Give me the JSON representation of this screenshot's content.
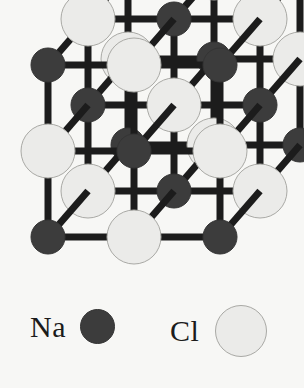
{
  "figure": {
    "kind": "crystal-lattice-diagram",
    "background_color": "#f7f7f5"
  },
  "chart_data": {
    "type": "scatter",
    "xlabel": "",
    "ylabel": "",
    "projection": "oblique",
    "grid_dimensions": [
      3,
      3,
      3
    ],
    "lattice_rule": "alternating: Na where (i+j+k) is even, Cl where (i+j+k) is odd",
    "origin": [
      48,
      237
    ],
    "step_x": 86,
    "step_y": -86,
    "depth_dx": 40,
    "depth_dy": -46,
    "bond_color": "#1c1c1c",
    "bond_width": 7,
    "species": [
      {
        "name": "Na",
        "label": "Na",
        "fill": "#3c3c3c",
        "stroke": "#343434",
        "radius": 17
      },
      {
        "name": "Cl",
        "label": "Cl",
        "fill": "#ebebe9",
        "stroke": "#a9a9a5",
        "radius": 27
      }
    ],
    "categories": [
      "Na",
      "Cl"
    ],
    "values": [
      14,
      13
    ],
    "legend": {
      "position": "bottom",
      "entries": [
        {
          "label": "Na",
          "swatch": "dark-filled-circle",
          "color": "#3c3c3c"
        },
        {
          "label": "Cl",
          "swatch": "light-outlined-circle",
          "color": "#ebebe9"
        }
      ]
    }
  },
  "legend": {
    "na_label": "Na",
    "cl_label": "Cl"
  }
}
